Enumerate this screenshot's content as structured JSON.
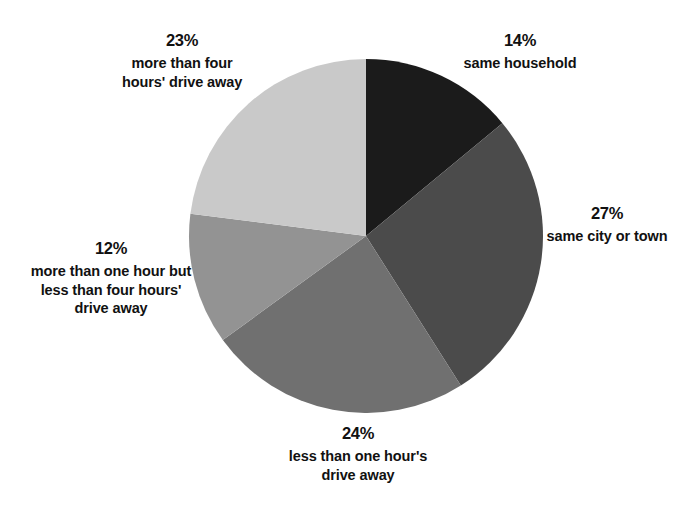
{
  "chart_data": {
    "type": "pie",
    "title": "",
    "subtitle": "",
    "xlabel": "",
    "ylabel": "",
    "legend_position": "outside-labels",
    "grid": false,
    "start_angle_deg": 0,
    "direction": "clockwise",
    "units": "%",
    "categories": [
      "same household",
      "same city or town",
      "less than one hour's\ndrive away",
      "more than one hour but\nless than four hours'\ndrive away",
      "more than four\nhours' drive away"
    ],
    "values": [
      14,
      27,
      24,
      12,
      23
    ],
    "slices": [
      {
        "id": "same-household",
        "percent_text": "14%",
        "value": 14,
        "label": "same household",
        "color": "#1b1b1b"
      },
      {
        "id": "same-city-or-town",
        "percent_text": "27%",
        "value": 27,
        "label": "same city or town",
        "color": "#4b4b4b"
      },
      {
        "id": "less-than-one-hour",
        "percent_text": "24%",
        "value": 24,
        "label": "less than one hour's\ndrive away",
        "color": "#707070"
      },
      {
        "id": "one-to-four-hours",
        "percent_text": "12%",
        "value": 12,
        "label": "more than one hour but\nless than four hours'\ndrive away",
        "color": "#939393"
      },
      {
        "id": "more-than-four-hours",
        "percent_text": "23%",
        "value": 23,
        "label": "more than four\nhours' drive away",
        "color": "#c9c9c9"
      }
    ],
    "total": 100
  },
  "colors": {
    "background": "#ffffff",
    "text": "#111111",
    "slice_1": "#1b1b1b",
    "slice_2": "#4b4b4b",
    "slice_3": "#707070",
    "slice_4": "#939393",
    "slice_5": "#c9c9c9"
  }
}
